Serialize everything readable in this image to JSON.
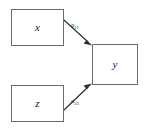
{
  "diagram": {
    "type": "path-diagram",
    "nodes": [
      {
        "id": "x",
        "label": "x",
        "role": "predictor-variable"
      },
      {
        "id": "z",
        "label": "z",
        "role": "predictor-variable"
      },
      {
        "id": "y",
        "label": "y",
        "role": "outcome-variable"
      }
    ],
    "edges": [
      {
        "id": "x-to-y",
        "from": "x",
        "to": "y",
        "coefficient_symbol": "a",
        "coefficient_subscript": "21",
        "direction": "rightward-down"
      },
      {
        "id": "z-to-y",
        "from": "z",
        "to": "y",
        "coefficient_symbol": "a",
        "coefficient_subscript": "23",
        "direction": "rightward-up"
      }
    ],
    "colors": {
      "background": "#ffffff",
      "box_border": "#6b6b6b",
      "edge": "#2b2b2b",
      "text": "#1a1a1a"
    }
  }
}
